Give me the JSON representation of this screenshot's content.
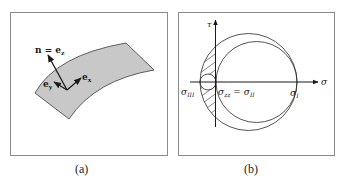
{
  "panels": [
    {
      "id": "a",
      "caption": "(a)",
      "labels": {
        "normal": "n = e",
        "normal_sub": "z",
        "ex": "e",
        "ex_sub": "x",
        "ey": "e",
        "ey_sub": "y"
      }
    },
    {
      "id": "b",
      "caption": "(b)",
      "labels": {
        "tau_axis": "τ",
        "sigma_axis": "σ",
        "sigma_III": "σ",
        "sigma_III_sub": "III",
        "sigma_zz": "σ",
        "sigma_zz_sub": "zz",
        "equals": " = σ",
        "sigma_II_sub": "II",
        "sigma_I": "σ",
        "sigma_I_sub": "I"
      }
    }
  ],
  "colors": {
    "line": "#2a2a2a",
    "surface_fill": "#c8c8c8",
    "frame": "#8a8a8a"
  }
}
